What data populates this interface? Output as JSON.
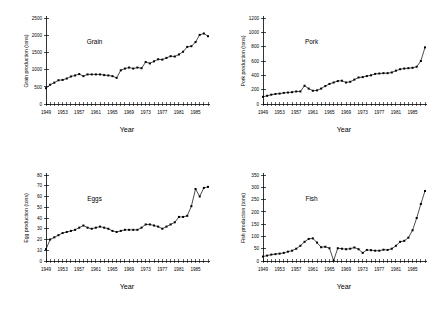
{
  "figure": {
    "panel_count": 4,
    "background_color": "#ffffff",
    "ink_color": "#000000"
  },
  "chart_data": [
    {
      "type": "line",
      "id": "grain",
      "title": "Grain",
      "xlabel": "Year",
      "ylabel": "Grain production (tons)",
      "xlim": [
        1949,
        1988
      ],
      "ylim": [
        0,
        2500
      ],
      "yticks": [
        0,
        500,
        1000,
        1500,
        2000,
        2500
      ],
      "xticks": [
        1949,
        1953,
        1957,
        1961,
        1965,
        1969,
        1973,
        1977,
        1981,
        1985
      ],
      "grid": false,
      "legend": "none",
      "markers": "filled-square",
      "x": [
        1949,
        1950,
        1951,
        1952,
        1953,
        1954,
        1955,
        1956,
        1957,
        1958,
        1959,
        1960,
        1961,
        1962,
        1963,
        1964,
        1965,
        1966,
        1967,
        1968,
        1969,
        1970,
        1971,
        1972,
        1973,
        1974,
        1975,
        1976,
        1977,
        1978,
        1979,
        1980,
        1981,
        1982,
        1983,
        1984,
        1985,
        1986,
        1987,
        1988
      ],
      "values": [
        460,
        560,
        620,
        690,
        700,
        740,
        800,
        830,
        870,
        810,
        860,
        860,
        860,
        860,
        840,
        830,
        810,
        760,
        980,
        1030,
        1060,
        1030,
        1060,
        1040,
        1220,
        1180,
        1240,
        1300,
        1290,
        1340,
        1390,
        1380,
        1440,
        1520,
        1660,
        1680,
        1800,
        2010,
        2050,
        1970,
        2060,
        2100,
        2110
      ]
    },
    {
      "type": "line",
      "id": "pork",
      "title": "Pork",
      "xlabel": "Year",
      "ylabel": "Pork production (tons)",
      "xlim": [
        1949,
        1988
      ],
      "ylim": [
        0,
        1200
      ],
      "yticks": [
        0,
        200,
        400,
        600,
        800,
        1000,
        1200
      ],
      "xticks": [
        1949,
        1953,
        1957,
        1961,
        1965,
        1969,
        1973,
        1977,
        1981,
        1985
      ],
      "grid": false,
      "legend": "none",
      "markers": "filled-square",
      "x": [
        1949,
        1950,
        1951,
        1952,
        1953,
        1954,
        1955,
        1956,
        1957,
        1958,
        1959,
        1960,
        1961,
        1962,
        1963,
        1964,
        1965,
        1966,
        1967,
        1968,
        1969,
        1970,
        1971,
        1972,
        1973,
        1974,
        1975,
        1976,
        1977,
        1978,
        1979,
        1980,
        1981,
        1982,
        1983,
        1984,
        1985,
        1986,
        1987,
        1988
      ],
      "values": [
        100,
        115,
        130,
        140,
        145,
        155,
        160,
        165,
        175,
        175,
        255,
        215,
        185,
        190,
        215,
        250,
        280,
        300,
        320,
        325,
        300,
        310,
        340,
        370,
        375,
        390,
        400,
        420,
        425,
        430,
        430,
        440,
        465,
        485,
        495,
        500,
        505,
        520,
        600,
        790,
        965
      ]
    },
    {
      "type": "line",
      "id": "eggs",
      "title": "Eggs",
      "xlabel": "Year",
      "ylabel": "Egg production (tons)",
      "xlim": [
        1949,
        1988
      ],
      "ylim": [
        0,
        80
      ],
      "yticks": [
        0,
        10,
        20,
        30,
        40,
        50,
        60,
        70,
        80
      ],
      "xticks": [
        1949,
        1953,
        1957,
        1961,
        1965,
        1969,
        1973,
        1977,
        1981,
        1985
      ],
      "grid": false,
      "legend": "none",
      "markers": "filled-square",
      "x": [
        1949,
        1950,
        1951,
        1952,
        1953,
        1954,
        1955,
        1956,
        1957,
        1958,
        1959,
        1960,
        1961,
        1962,
        1963,
        1964,
        1965,
        1966,
        1967,
        1968,
        1969,
        1970,
        1971,
        1972,
        1973,
        1974,
        1975,
        1976,
        1977,
        1978,
        1979,
        1980,
        1981,
        1982,
        1983,
        1984,
        1985,
        1986,
        1987,
        1988
      ],
      "values": [
        11,
        20,
        22,
        24,
        26,
        27,
        28,
        29,
        31,
        33,
        31,
        30,
        31,
        32,
        31,
        30,
        28,
        27,
        28,
        29,
        29,
        29,
        29,
        31,
        34,
        34,
        33,
        32,
        30,
        32,
        34,
        36,
        41,
        41,
        42,
        51,
        67,
        60,
        68,
        69,
        67
      ]
    },
    {
      "type": "line",
      "id": "fish",
      "title": "Fish",
      "xlabel": "Year",
      "ylabel": "Fish production (tons)",
      "xlim": [
        1949,
        1988
      ],
      "ylim": [
        0,
        350
      ],
      "yticks": [
        0,
        50,
        100,
        150,
        200,
        250,
        300,
        350
      ],
      "xticks": [
        1949,
        1953,
        1957,
        1961,
        1965,
        1969,
        1973,
        1977,
        1981,
        1985
      ],
      "grid": false,
      "legend": "none",
      "markers": "filled-square",
      "x": [
        1949,
        1950,
        1951,
        1952,
        1953,
        1954,
        1955,
        1956,
        1957,
        1958,
        1959,
        1960,
        1961,
        1962,
        1963,
        1964,
        1965,
        1966,
        1967,
        1968,
        1969,
        1970,
        1971,
        1972,
        1973,
        1974,
        1975,
        1976,
        1977,
        1978,
        1979,
        1980,
        1981,
        1982,
        1983,
        1984,
        1985,
        1986,
        1987,
        1988
      ],
      "values": [
        18,
        22,
        26,
        28,
        30,
        33,
        38,
        42,
        50,
        62,
        78,
        90,
        92,
        75,
        56,
        58,
        52,
        2,
        52,
        50,
        48,
        50,
        55,
        48,
        33,
        45,
        44,
        42,
        42,
        46,
        45,
        50,
        62,
        78,
        82,
        95,
        125,
        175,
        232,
        285,
        303
      ]
    }
  ]
}
